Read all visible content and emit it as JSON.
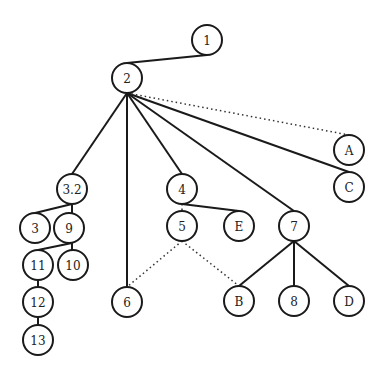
{
  "diagram": {
    "type": "tree",
    "node_radius": 15,
    "nodes": [
      {
        "id": "1",
        "label": "1",
        "x": 207,
        "y": 40
      },
      {
        "id": "2",
        "label": "2",
        "x": 127,
        "y": 78
      },
      {
        "id": "A",
        "label": "A",
        "x": 349,
        "y": 150
      },
      {
        "id": "C",
        "label": "C",
        "x": 349,
        "y": 187
      },
      {
        "id": "3.2",
        "label": "3.2",
        "x": 72,
        "y": 189
      },
      {
        "id": "4",
        "label": "4",
        "x": 182,
        "y": 189
      },
      {
        "id": "3",
        "label": "3",
        "x": 35,
        "y": 228
      },
      {
        "id": "9",
        "label": "9",
        "x": 69,
        "y": 228
      },
      {
        "id": "5",
        "label": "5",
        "x": 182,
        "y": 226
      },
      {
        "id": "E",
        "label": "E",
        "x": 239,
        "y": 226
      },
      {
        "id": "7",
        "label": "7",
        "x": 294,
        "y": 226
      },
      {
        "id": "11",
        "label": "11",
        "x": 38,
        "y": 265
      },
      {
        "id": "10",
        "label": "10",
        "x": 73,
        "y": 265
      },
      {
        "id": "6",
        "label": "6",
        "x": 127,
        "y": 302
      },
      {
        "id": "B",
        "label": "B",
        "x": 239,
        "y": 301
      },
      {
        "id": "8",
        "label": "8",
        "x": 294,
        "y": 301
      },
      {
        "id": "D",
        "label": "D",
        "x": 349,
        "y": 301
      },
      {
        "id": "12",
        "label": "12",
        "x": 38,
        "y": 302
      },
      {
        "id": "13",
        "label": "13",
        "x": 38,
        "y": 340
      }
    ],
    "edges": [
      {
        "from": "1",
        "to": "2",
        "style": "solid",
        "x1": 207,
        "y1": 55,
        "x2": 127,
        "y2": 63
      },
      {
        "from": "2",
        "to": "3.2",
        "style": "solid",
        "x1": 127,
        "y1": 93,
        "x2": 72,
        "y2": 174
      },
      {
        "from": "2",
        "to": "6",
        "style": "solid",
        "x1": 127,
        "y1": 93,
        "x2": 127,
        "y2": 287
      },
      {
        "from": "2",
        "to": "4",
        "style": "solid",
        "x1": 127,
        "y1": 93,
        "x2": 182,
        "y2": 174
      },
      {
        "from": "2",
        "to": "7",
        "style": "solid",
        "x1": 127,
        "y1": 93,
        "x2": 294,
        "y2": 211
      },
      {
        "from": "2",
        "to": "C",
        "style": "solid",
        "x1": 127,
        "y1": 93,
        "x2": 349,
        "y2": 172
      },
      {
        "from": "2",
        "to": "A",
        "style": "dotted",
        "x1": 127,
        "y1": 93,
        "x2": 349,
        "y2": 135
      },
      {
        "from": "3.2",
        "to": "3",
        "style": "solid",
        "x1": 72,
        "y1": 204,
        "x2": 35,
        "y2": 213
      },
      {
        "from": "3.2",
        "to": "9",
        "style": "solid",
        "x1": 72,
        "y1": 204,
        "x2": 72,
        "y2": 213
      },
      {
        "from": "9",
        "to": "11",
        "style": "solid",
        "x1": 72,
        "y1": 243,
        "x2": 38,
        "y2": 250
      },
      {
        "from": "9",
        "to": "10",
        "style": "solid",
        "x1": 72,
        "y1": 243,
        "x2": 72,
        "y2": 250
      },
      {
        "from": "11",
        "to": "12",
        "style": "solid",
        "x1": 38,
        "y1": 280,
        "x2": 38,
        "y2": 287
      },
      {
        "from": "12",
        "to": "13",
        "style": "solid",
        "x1": 38,
        "y1": 317,
        "x2": 38,
        "y2": 325
      },
      {
        "from": "4",
        "to": "E",
        "style": "solid",
        "x1": 182,
        "y1": 204,
        "x2": 239,
        "y2": 211
      },
      {
        "from": "4",
        "to": "5",
        "style": "dotted",
        "x1": 182,
        "y1": 204,
        "x2": 182,
        "y2": 211
      },
      {
        "from": "5",
        "to": "6",
        "style": "dotted",
        "x1": 182,
        "y1": 241,
        "x2": 127,
        "y2": 287
      },
      {
        "from": "5",
        "to": "B",
        "style": "dotted",
        "x1": 182,
        "y1": 241,
        "x2": 239,
        "y2": 286
      },
      {
        "from": "7",
        "to": "B",
        "style": "solid",
        "x1": 294,
        "y1": 241,
        "x2": 239,
        "y2": 286
      },
      {
        "from": "7",
        "to": "8",
        "style": "solid",
        "x1": 294,
        "y1": 241,
        "x2": 294,
        "y2": 286
      },
      {
        "from": "7",
        "to": "D",
        "style": "solid",
        "x1": 294,
        "y1": 241,
        "x2": 349,
        "y2": 286
      }
    ]
  }
}
